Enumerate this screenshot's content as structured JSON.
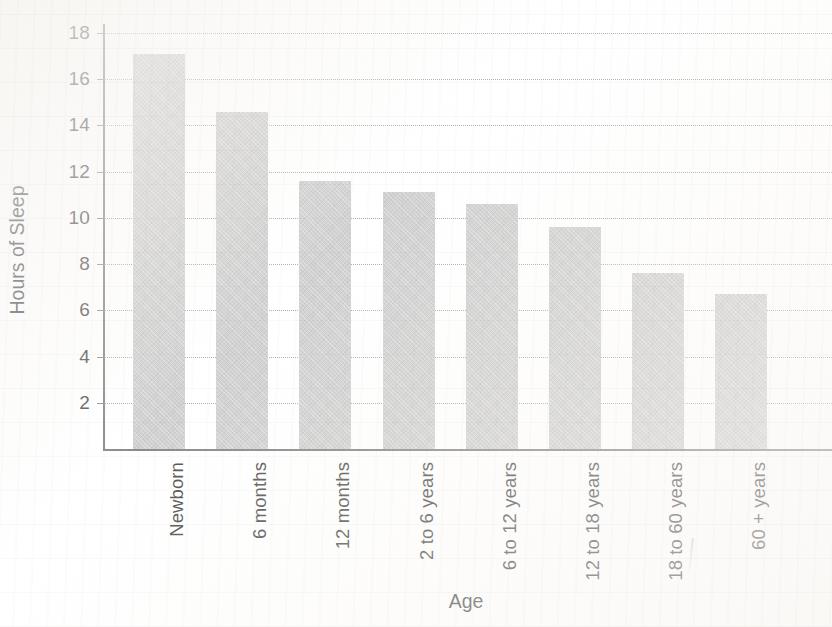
{
  "chart_data": {
    "type": "bar",
    "title": "",
    "xlabel": "Age",
    "ylabel": "Hours of Sleep",
    "categories": [
      "Newborn",
      "6 months",
      "12 months",
      "2 to 6 years",
      "6 to 12 years",
      "12 to 18 years",
      "18 to 60 years",
      "60 + years"
    ],
    "values": [
      17.1,
      14.6,
      11.6,
      11.1,
      10.6,
      9.6,
      7.6,
      6.7
    ],
    "ylim": [
      0,
      18
    ],
    "yticks": [
      2,
      4,
      6,
      8,
      10,
      12,
      14,
      16,
      18
    ],
    "ytick_labels": [
      "2",
      "4",
      "6",
      "8",
      "10",
      "12",
      "14",
      "16",
      "18"
    ],
    "grid": "horizontal-dotted",
    "legend": "none",
    "bar_color": "#c6c6c6",
    "axis_color": "#6e6e6e",
    "gridline_color": "#9b9b9b",
    "text_color": "#2b2b2b",
    "background": "#ffffff"
  }
}
